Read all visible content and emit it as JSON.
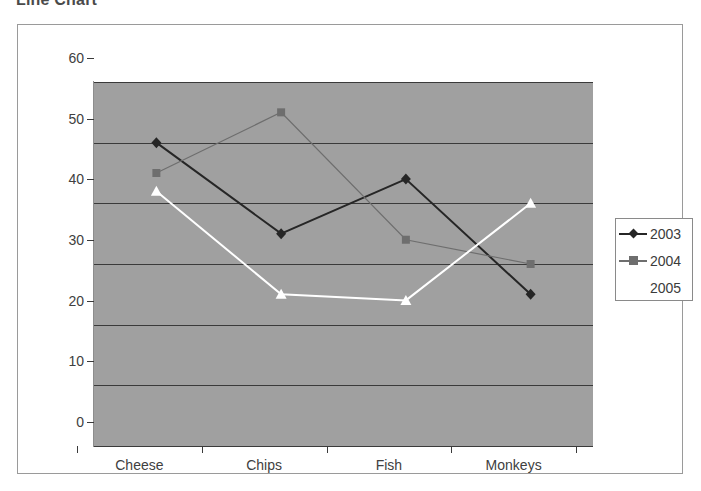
{
  "page": {
    "title": "Line Chart"
  },
  "legend": {
    "position": "right",
    "entries": [
      {
        "label": "2003",
        "color": "#262626",
        "marker": "diamond"
      },
      {
        "label": "2004",
        "color": "#6e6e6e",
        "marker": "square"
      },
      {
        "label": "2005",
        "color": "#ffffff",
        "marker": "triangle"
      }
    ]
  },
  "axes": {
    "y_ticks": [
      "0",
      "10",
      "20",
      "30",
      "40",
      "50",
      "60"
    ],
    "x_ticks": [
      "Cheese",
      "Chips",
      "Fish",
      "Monkeys"
    ]
  },
  "colors": {
    "plot_background": "#a0a0a0",
    "frame_border": "#9a9a9a",
    "gridline": "#3a3a3a",
    "axis_text": "#404040",
    "title_text": "#4a4a4a"
  },
  "chart_data": {
    "type": "line",
    "title": "Line Chart",
    "xlabel": "",
    "ylabel": "",
    "categories": [
      "Cheese",
      "Chips",
      "Fish",
      "Monkeys"
    ],
    "series": [
      {
        "name": "2003",
        "values": [
          50,
          35,
          44,
          25
        ],
        "color": "#262626",
        "marker": "diamond"
      },
      {
        "name": "2004",
        "values": [
          45,
          55,
          34,
          30
        ],
        "color": "#6e6e6e",
        "marker": "square"
      },
      {
        "name": "2005",
        "values": [
          42,
          25,
          24,
          40
        ],
        "color": "#ffffff",
        "marker": "triangle"
      }
    ],
    "ylim": [
      0,
      60
    ],
    "ytick_step": 10,
    "grid": true,
    "legend_position": "right"
  }
}
